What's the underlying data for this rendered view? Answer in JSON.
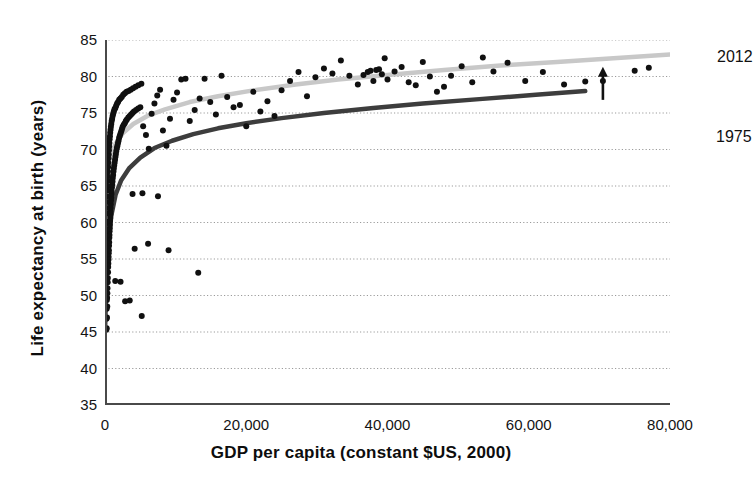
{
  "chart_data": {
    "type": "scatter",
    "title": "",
    "xlabel": "GDP per capita (constant $US, 2000)",
    "ylabel": "Life expectancy at birth (years)",
    "xlim": [
      0,
      80000
    ],
    "ylim": [
      35,
      85
    ],
    "grid": true,
    "grid_style": "dotted-horizontal",
    "legend_position": "inline-annotation",
    "xticks": [
      0,
      20000,
      40000,
      60000,
      80000
    ],
    "xtick_labels": [
      "0",
      "20,000",
      "40,000",
      "60,000",
      "80,000"
    ],
    "xminor_ticks": [
      10000,
      30000,
      50000,
      70000
    ],
    "yticks": [
      35,
      40,
      45,
      50,
      55,
      60,
      65,
      70,
      75,
      80,
      85
    ],
    "ytick_labels": [
      "35",
      "40",
      "45",
      "50",
      "55",
      "60",
      "65",
      "70",
      "75",
      "80",
      "85"
    ],
    "annotations": [
      {
        "text": "2012",
        "x": 74000,
        "y": 85.5,
        "name": "curve-label-2012"
      },
      {
        "text": "1975",
        "x": 73500,
        "y": 73.5,
        "name": "curve-label-1975"
      },
      {
        "text": "arrow",
        "x": 70500,
        "y_from": 76.8,
        "y_to": 81.2,
        "name": "gap-arrow"
      }
    ],
    "series": [
      {
        "name": "2012 fitted curve",
        "type": "line",
        "color": "#c8c8c8",
        "points": [
          [
            0,
            64.5
          ],
          [
            300,
            67.2
          ],
          [
            800,
            69.2
          ],
          [
            1500,
            70.8
          ],
          [
            2500,
            72.2
          ],
          [
            4000,
            73.5
          ],
          [
            6000,
            74.6
          ],
          [
            8500,
            75.5
          ],
          [
            12000,
            76.5
          ],
          [
            16000,
            77.3
          ],
          [
            21000,
            78.1
          ],
          [
            27000,
            78.9
          ],
          [
            33000,
            79.6
          ],
          [
            40000,
            80.2
          ],
          [
            48000,
            80.9
          ],
          [
            56000,
            81.5
          ],
          [
            64000,
            82.0
          ],
          [
            72000,
            82.5
          ],
          [
            80000,
            83.0
          ]
        ]
      },
      {
        "name": "1975 fitted curve",
        "type": "line",
        "color": "#3d3d3d",
        "points": [
          [
            0,
            45.0
          ],
          [
            200,
            52.0
          ],
          [
            500,
            57.5
          ],
          [
            900,
            61.0
          ],
          [
            1500,
            63.8
          ],
          [
            2300,
            65.8
          ],
          [
            3400,
            67.4
          ],
          [
            5000,
            68.9
          ],
          [
            7000,
            70.2
          ],
          [
            9500,
            71.2
          ],
          [
            12500,
            72.1
          ],
          [
            16000,
            72.9
          ],
          [
            20000,
            73.6
          ],
          [
            25000,
            74.3
          ],
          [
            31000,
            75.0
          ],
          [
            38000,
            75.7
          ],
          [
            45000,
            76.3
          ],
          [
            53000,
            76.9
          ],
          [
            61000,
            77.5
          ],
          [
            68000,
            78.0
          ]
        ]
      },
      {
        "name": "Countries (observations)",
        "type": "scatter",
        "color": "#101010",
        "marker_size": 6,
        "points": [
          [
            180,
            45.3
          ],
          [
            210,
            46.8
          ],
          [
            240,
            48.2
          ],
          [
            260,
            49.4
          ],
          [
            300,
            49.7
          ],
          [
            330,
            50.3
          ],
          [
            350,
            51.0
          ],
          [
            380,
            51.8
          ],
          [
            400,
            52.4
          ],
          [
            430,
            53.2
          ],
          [
            450,
            53.9
          ],
          [
            470,
            54.4
          ],
          [
            490,
            54.9
          ],
          [
            510,
            55.3
          ],
          [
            530,
            55.8
          ],
          [
            550,
            56.2
          ],
          [
            570,
            56.8
          ],
          [
            590,
            57.3
          ],
          [
            610,
            57.9
          ],
          [
            630,
            58.3
          ],
          [
            650,
            58.8
          ],
          [
            670,
            59.2
          ],
          [
            690,
            59.7
          ],
          [
            710,
            60.2
          ],
          [
            730,
            60.6
          ],
          [
            750,
            61.1
          ],
          [
            770,
            61.5
          ],
          [
            790,
            62.0
          ],
          [
            820,
            62.5
          ],
          [
            850,
            63.0
          ],
          [
            880,
            63.4
          ],
          [
            910,
            63.9
          ],
          [
            940,
            64.3
          ],
          [
            980,
            64.8
          ],
          [
            1020,
            65.2
          ],
          [
            1060,
            65.6
          ],
          [
            1100,
            66.1
          ],
          [
            1150,
            66.5
          ],
          [
            1200,
            67.0
          ],
          [
            1250,
            67.4
          ],
          [
            1300,
            67.8
          ],
          [
            1360,
            68.2
          ],
          [
            1420,
            68.6
          ],
          [
            1480,
            69.0
          ],
          [
            1540,
            69.4
          ],
          [
            1600,
            69.8
          ],
          [
            1680,
            70.2
          ],
          [
            1760,
            70.5
          ],
          [
            1840,
            70.9
          ],
          [
            1920,
            71.2
          ],
          [
            2000,
            71.6
          ],
          [
            2100,
            71.9
          ],
          [
            2200,
            72.2
          ],
          [
            2300,
            72.5
          ],
          [
            2400,
            72.8
          ],
          [
            2500,
            73.1
          ],
          [
            2650,
            73.4
          ],
          [
            2800,
            73.6
          ],
          [
            2950,
            73.9
          ],
          [
            3100,
            74.1
          ],
          [
            3300,
            74.4
          ],
          [
            3500,
            74.6
          ],
          [
            3700,
            74.8
          ],
          [
            3900,
            75.0
          ],
          [
            4100,
            75.2
          ],
          [
            4400,
            75.4
          ],
          [
            4700,
            75.6
          ],
          [
            5000,
            75.8
          ],
          [
            5400,
            73.2
          ],
          [
            5800,
            72.0
          ],
          [
            6200,
            70.1
          ],
          [
            6600,
            74.9
          ],
          [
            7000,
            76.3
          ],
          [
            7400,
            77.4
          ],
          [
            7800,
            78.2
          ],
          [
            8200,
            72.6
          ],
          [
            8700,
            70.5
          ],
          [
            9200,
            74.2
          ],
          [
            9700,
            76.8
          ],
          [
            10200,
            77.8
          ],
          [
            10800,
            79.6
          ],
          [
            11400,
            79.7
          ],
          [
            12000,
            73.9
          ],
          [
            12700,
            75.4
          ],
          [
            13400,
            77.0
          ],
          [
            14100,
            79.7
          ],
          [
            14900,
            76.5
          ],
          [
            15700,
            74.8
          ],
          [
            16500,
            80.1
          ],
          [
            17300,
            77.2
          ],
          [
            18200,
            75.8
          ],
          [
            19100,
            76.1
          ],
          [
            20000,
            73.2
          ],
          [
            21000,
            77.9
          ],
          [
            22000,
            75.2
          ],
          [
            23000,
            76.6
          ],
          [
            24000,
            74.6
          ],
          [
            25000,
            78.1
          ],
          [
            26200,
            79.4
          ],
          [
            27400,
            80.6
          ],
          [
            28600,
            77.3
          ],
          [
            29800,
            79.9
          ],
          [
            31000,
            81.1
          ],
          [
            32200,
            80.4
          ],
          [
            33400,
            82.2
          ],
          [
            34600,
            80.1
          ],
          [
            35800,
            78.9
          ],
          [
            36600,
            80.2
          ],
          [
            37200,
            80.6
          ],
          [
            37600,
            80.8
          ],
          [
            38000,
            79.4
          ],
          [
            38400,
            80.9
          ],
          [
            38800,
            81.0
          ],
          [
            39200,
            80.3
          ],
          [
            39600,
            82.5
          ],
          [
            40000,
            79.6
          ],
          [
            41000,
            80.7
          ],
          [
            42000,
            81.3
          ],
          [
            43000,
            79.2
          ],
          [
            44000,
            78.8
          ],
          [
            45000,
            82.0
          ],
          [
            46000,
            80.0
          ],
          [
            47000,
            77.9
          ],
          [
            48000,
            78.6
          ],
          [
            49000,
            80.1
          ],
          [
            50500,
            81.4
          ],
          [
            52000,
            79.2
          ],
          [
            53500,
            82.6
          ],
          [
            55000,
            80.7
          ],
          [
            57000,
            81.9
          ],
          [
            59500,
            79.4
          ],
          [
            62000,
            80.6
          ],
          [
            65000,
            78.9
          ],
          [
            68000,
            79.3
          ],
          [
            70500,
            79.4
          ],
          [
            75000,
            80.8
          ],
          [
            77000,
            81.2
          ],
          [
            120,
            55.6
          ],
          [
            140,
            56.4
          ],
          [
            160,
            57.2
          ],
          [
            175,
            58.1
          ],
          [
            195,
            59.0
          ],
          [
            215,
            60.1
          ],
          [
            235,
            61.2
          ],
          [
            255,
            62.0
          ],
          [
            275,
            62.8
          ],
          [
            295,
            63.6
          ],
          [
            315,
            64.4
          ],
          [
            340,
            65.0
          ],
          [
            365,
            65.7
          ],
          [
            390,
            66.3
          ],
          [
            415,
            67.0
          ],
          [
            440,
            67.6
          ],
          [
            465,
            68.2
          ],
          [
            495,
            68.8
          ],
          [
            525,
            69.3
          ],
          [
            555,
            69.9
          ],
          [
            585,
            70.4
          ],
          [
            620,
            70.9
          ],
          [
            655,
            71.4
          ],
          [
            695,
            71.8
          ],
          [
            735,
            72.3
          ],
          [
            780,
            72.7
          ],
          [
            830,
            73.1
          ],
          [
            885,
            73.5
          ],
          [
            945,
            73.9
          ],
          [
            1010,
            74.2
          ],
          [
            1080,
            74.6
          ],
          [
            1160,
            74.9
          ],
          [
            1250,
            75.2
          ],
          [
            1350,
            75.5
          ],
          [
            1460,
            75.7
          ],
          [
            1580,
            76.0
          ],
          [
            1710,
            76.3
          ],
          [
            1850,
            76.5
          ],
          [
            2010,
            76.8
          ],
          [
            2180,
            77.0
          ],
          [
            2370,
            77.2
          ],
          [
            2580,
            77.5
          ],
          [
            2810,
            77.7
          ],
          [
            3060,
            77.9
          ],
          [
            3340,
            78.0
          ],
          [
            3640,
            78.2
          ],
          [
            3970,
            78.4
          ],
          [
            4330,
            78.6
          ],
          [
            4720,
            78.8
          ],
          [
            5150,
            79.0
          ],
          [
            240,
            45.5
          ],
          [
            280,
            47.0
          ],
          [
            320,
            48.5
          ],
          [
            1450,
            52.0
          ],
          [
            2200,
            51.9
          ],
          [
            2850,
            49.2
          ],
          [
            3500,
            49.3
          ],
          [
            5200,
            47.2
          ],
          [
            4200,
            56.4
          ],
          [
            6100,
            57.1
          ],
          [
            3900,
            63.9
          ],
          [
            5300,
            64.0
          ],
          [
            13200,
            53.1
          ],
          [
            9000,
            56.2
          ],
          [
            7500,
            63.6
          ]
        ]
      }
    ]
  }
}
